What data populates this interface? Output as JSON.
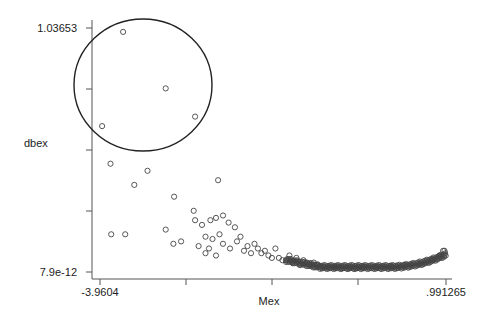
{
  "chart_data": {
    "type": "scatter",
    "title": "",
    "xlabel": "Mex",
    "ylabel": "dbex",
    "xlim": [
      -3.9604,
      0.991265
    ],
    "ylim": [
      7.9e-12,
      1.03653
    ],
    "x_tick_labels": [
      "-3.9604",
      ".991265"
    ],
    "y_tick_labels": [
      "1.03653",
      "7.9e-12"
    ],
    "x_ticks_count": 5,
    "y_ticks_count": 5,
    "grid": false,
    "legend": null,
    "marker": "hollow-circle",
    "annotation": {
      "type": "circle",
      "description": "hand-drawn circle highlighting the four outlying points with largest dbex",
      "center_px": [
        143,
        85
      ],
      "radius_px": [
        69,
        66
      ]
    },
    "points": [
      [
        -3.63,
        1.02
      ],
      [
        -3.02,
        0.78
      ],
      [
        -2.6,
        0.66
      ],
      [
        -3.93,
        0.62
      ],
      [
        -3.81,
        0.46
      ],
      [
        -3.28,
        0.43
      ],
      [
        -3.47,
        0.37
      ],
      [
        -2.27,
        0.39
      ],
      [
        -2.9,
        0.32
      ],
      [
        -2.62,
        0.26
      ],
      [
        -3.8,
        0.16
      ],
      [
        -3.6,
        0.16
      ],
      [
        -3.02,
        0.18
      ],
      [
        -2.91,
        0.12
      ],
      [
        -2.8,
        0.13
      ],
      [
        -2.6,
        0.22
      ],
      [
        -2.5,
        0.2
      ],
      [
        -2.38,
        0.22
      ],
      [
        -2.3,
        0.23
      ],
      [
        -2.2,
        0.24
      ],
      [
        -2.12,
        0.21
      ],
      [
        -2.03,
        0.19
      ],
      [
        -2.45,
        0.15
      ],
      [
        -2.35,
        0.14
      ],
      [
        -2.25,
        0.16
      ],
      [
        -2.55,
        0.11
      ],
      [
        -2.45,
        0.08
      ],
      [
        -2.4,
        0.1
      ],
      [
        -2.3,
        0.07
      ],
      [
        -2.2,
        0.12
      ],
      [
        -2.1,
        0.1
      ],
      [
        -2.0,
        0.13
      ],
      [
        -1.95,
        0.15
      ],
      [
        -1.9,
        0.09
      ],
      [
        -1.85,
        0.11
      ],
      [
        -1.8,
        0.08
      ],
      [
        -1.75,
        0.12
      ],
      [
        -1.7,
        0.1
      ],
      [
        -1.65,
        0.08
      ],
      [
        -1.6,
        0.09
      ],
      [
        -1.55,
        0.07
      ],
      [
        -1.5,
        0.06
      ],
      [
        -1.45,
        0.1
      ],
      [
        -1.4,
        0.06
      ],
      [
        -1.35,
        0.05
      ],
      [
        -1.3,
        0.05
      ],
      [
        -1.25,
        0.07
      ],
      [
        -1.2,
        0.04
      ],
      [
        -1.15,
        0.06
      ],
      [
        -1.1,
        0.03
      ],
      [
        -1.05,
        0.05
      ],
      [
        -1.0,
        0.04
      ],
      [
        -0.95,
        0.03
      ],
      [
        -0.9,
        0.04
      ],
      [
        -0.85,
        0.03
      ],
      [
        -0.8,
        0.02
      ],
      [
        -0.7,
        0.02
      ],
      [
        -0.6,
        0.02
      ],
      [
        -0.5,
        0.015
      ],
      [
        -0.4,
        0.015
      ],
      [
        -0.3,
        0.015
      ],
      [
        -0.2,
        0.02
      ],
      [
        0.0,
        0.02
      ],
      [
        0.2,
        0.025
      ],
      [
        0.4,
        0.03
      ],
      [
        0.6,
        0.035
      ],
      [
        0.8,
        0.05
      ],
      [
        0.9,
        0.07
      ],
      [
        0.95,
        0.09
      ],
      [
        0.97,
        0.09
      ]
    ]
  }
}
